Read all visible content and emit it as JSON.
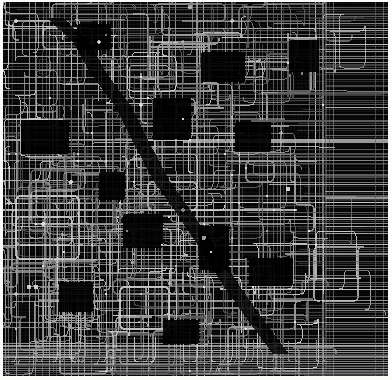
{
  "figure": {
    "kind": "circuit-routing-layout",
    "width_px": 392,
    "height_px": 380
  },
  "palette": {
    "paper": "#fbfbf9",
    "substrate": "#050505",
    "substrate_deep": "#000000",
    "trace_bright": "#cfcfcf",
    "trace_mid": "#9a9a9a",
    "trace_dim": "#5e5e5e",
    "trace_faint": "#333333",
    "via_node": "#e8e8e8"
  },
  "plate": {
    "x": 3,
    "y": 2,
    "width": 385,
    "height": 374
  },
  "geometry": {
    "trace_width": 1.0,
    "trace_width_heavy": 1.6,
    "corner_radius": 5,
    "via_radius": 1.6,
    "routing_pitch": 7
  },
  "regions": [
    {
      "name": "routing-field-main",
      "x": 3,
      "y": 2,
      "width": 322,
      "height": 374,
      "style": "orthogonal-mesh"
    },
    {
      "name": "bus-field-right",
      "x": 325,
      "y": 2,
      "width": 60,
      "height": 374,
      "style": "horizontal-bus"
    },
    {
      "name": "bus-band-bottom",
      "x": 3,
      "y": 344,
      "width": 385,
      "height": 32,
      "style": "horizontal-bus-dense"
    },
    {
      "name": "bus-band-top",
      "x": 3,
      "y": 2,
      "width": 385,
      "height": 22,
      "style": "vertical-comb"
    }
  ],
  "vertical_rails": [
    6,
    13,
    19,
    26,
    33,
    40,
    47,
    54,
    61,
    68,
    75,
    82,
    89,
    96,
    103,
    110,
    117,
    124,
    131,
    138,
    145,
    152,
    159,
    166,
    173,
    180,
    187,
    194,
    201,
    208,
    215,
    222,
    229,
    236,
    243,
    250,
    257,
    264,
    271,
    278,
    285,
    292,
    299,
    306,
    313,
    320
  ],
  "horizontal_rails": [
    5,
    12,
    19,
    26,
    33,
    40,
    47,
    54,
    61,
    68,
    75,
    82,
    89,
    96,
    103,
    110,
    117,
    124,
    131,
    138,
    145,
    152,
    159,
    166,
    173,
    180,
    187,
    194,
    201,
    208,
    215,
    222,
    229,
    236,
    243,
    250,
    257,
    264,
    271,
    278,
    285,
    292,
    299,
    306,
    313,
    320,
    327,
    334,
    341,
    348,
    355,
    362,
    369
  ],
  "right_bus_lines": [
    7,
    14,
    21,
    28,
    35,
    42,
    49,
    56,
    63,
    70,
    77,
    84,
    91,
    98,
    105,
    112,
    119,
    126,
    133,
    140,
    147,
    154,
    161,
    168,
    175,
    182,
    189,
    196,
    203,
    210,
    217,
    224,
    231,
    238,
    245,
    252,
    259,
    266,
    273,
    280,
    287,
    294,
    301,
    308,
    315,
    322,
    329,
    336,
    343,
    350,
    357,
    364,
    371
  ],
  "dark_voids": [
    {
      "x": 18,
      "y": 118,
      "width": 48,
      "height": 34
    },
    {
      "x": 74,
      "y": 22,
      "width": 34,
      "height": 26
    },
    {
      "x": 198,
      "y": 50,
      "width": 44,
      "height": 30
    },
    {
      "x": 150,
      "y": 96,
      "width": 38,
      "height": 42
    },
    {
      "x": 232,
      "y": 120,
      "width": 36,
      "height": 30
    },
    {
      "x": 120,
      "y": 212,
      "width": 40,
      "height": 34
    },
    {
      "x": 196,
      "y": 224,
      "width": 30,
      "height": 44
    },
    {
      "x": 246,
      "y": 256,
      "width": 44,
      "height": 28
    },
    {
      "x": 56,
      "y": 280,
      "width": 34,
      "height": 30
    },
    {
      "x": 160,
      "y": 318,
      "width": 36,
      "height": 24
    },
    {
      "x": 286,
      "y": 38,
      "width": 30,
      "height": 32
    },
    {
      "x": 96,
      "y": 170,
      "width": 26,
      "height": 28
    }
  ],
  "diagonal_seam": {
    "name": "staircase-seam",
    "points": [
      [
        60,
        16
      ],
      [
        86,
        40
      ],
      [
        104,
        72
      ],
      [
        128,
        104
      ],
      [
        146,
        140
      ],
      [
        166,
        178
      ],
      [
        190,
        212
      ],
      [
        214,
        248
      ],
      [
        238,
        286
      ],
      [
        262,
        320
      ],
      [
        286,
        352
      ]
    ],
    "note": "staircase void running from upper-left toward lower-right"
  },
  "via_nodes": [
    [
      47,
      96
    ],
    [
      89,
      131
    ],
    [
      131,
      180
    ],
    [
      166,
      215
    ],
    [
      208,
      250
    ],
    [
      250,
      285
    ],
    [
      292,
      320
    ],
    [
      61,
      250
    ],
    [
      103,
      292
    ],
    [
      145,
      96
    ],
    [
      187,
      138
    ],
    [
      229,
      173
    ],
    [
      271,
      208
    ],
    [
      313,
      243
    ],
    [
      75,
      159
    ],
    [
      117,
      201
    ],
    [
      159,
      243
    ],
    [
      201,
      285
    ],
    [
      243,
      327
    ],
    [
      285,
      61
    ],
    [
      320,
      103
    ],
    [
      33,
      222
    ],
    [
      96,
      40
    ],
    [
      138,
      75
    ],
    [
      180,
      117
    ],
    [
      222,
      152
    ],
    [
      264,
      194
    ],
    [
      306,
      229
    ]
  ],
  "density_profile": {
    "note": "trace density decreases toward right bus field",
    "columns": [
      0.92,
      0.95,
      0.9,
      0.88,
      0.84,
      0.52,
      0.3
    ]
  }
}
